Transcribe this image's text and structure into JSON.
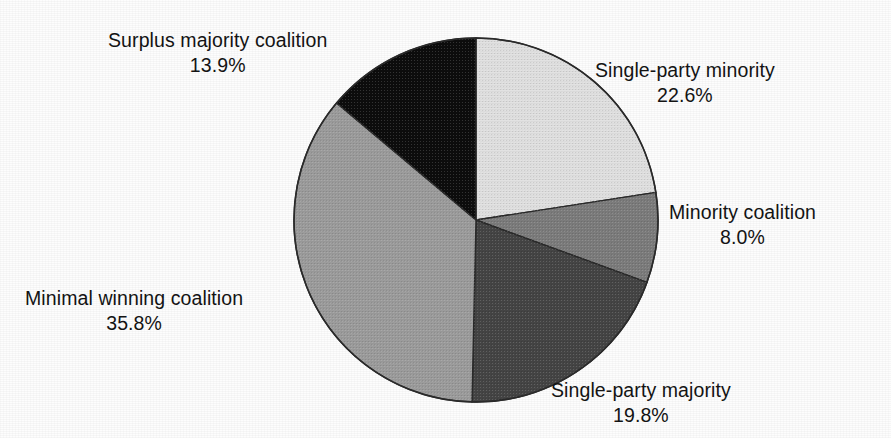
{
  "chart_data": {
    "type": "pie",
    "title": "",
    "subtitle": "",
    "xlabel": "",
    "ylabel": "",
    "legend_position": "none",
    "grid": false,
    "start_angle_deg": 0,
    "direction": "clockwise",
    "units": "percent",
    "categories": [
      "Single-party minority",
      "Minority coalition",
      "Single-party majority",
      "Minimal winning coalition",
      "Surplus majority coalition"
    ],
    "values": [
      22.6,
      8.0,
      19.8,
      35.8,
      13.9
    ],
    "value_labels": [
      "22.6%",
      "8.0%",
      "19.8%",
      "35.8%",
      "13.9%"
    ],
    "colors": [
      "#e2e2e2",
      "#7d7d7d",
      "#454545",
      "#9d9d9d",
      "#0d0d0d"
    ],
    "slices": [
      {
        "name": "Single-party minority",
        "value": 22.6,
        "value_label": "22.6%",
        "color": "#e2e2e2",
        "start_deg": 0.0,
        "end_deg": 81.36
      },
      {
        "name": "Minority coalition",
        "value": 8.0,
        "value_label": "8.0%",
        "color": "#7d7d7d",
        "start_deg": 81.36,
        "end_deg": 110.16
      },
      {
        "name": "Single-party majority",
        "value": 19.8,
        "value_label": "19.8%",
        "color": "#454545",
        "start_deg": 110.16,
        "end_deg": 181.44
      },
      {
        "name": "Minimal winning coalition",
        "value": 35.8,
        "value_label": "35.8%",
        "color": "#9d9d9d",
        "start_deg": 181.44,
        "end_deg": 310.32
      },
      {
        "name": "Surplus majority coalition",
        "value": 13.9,
        "value_label": "13.9%",
        "color": "#0d0d0d",
        "start_deg": 310.32,
        "end_deg": 360.0
      }
    ]
  },
  "labels": {
    "surplus_majority": {
      "name": "Surplus majority coalition",
      "pct": "13.9%"
    },
    "single_party_minority": {
      "name": "Single-party minority",
      "pct": "22.6%"
    },
    "minority_coalition": {
      "name": "Minority coalition",
      "pct": "8.0%"
    },
    "minimal_winning_coalition": {
      "name": "Minimal winning coalition",
      "pct": "35.8%"
    },
    "single_party_majority": {
      "name": "Single-party majority",
      "pct": "19.8%"
    }
  },
  "style": {
    "background": "#fdfdfd",
    "text_color": "#141414",
    "outline_color": "#2b2b2b"
  }
}
